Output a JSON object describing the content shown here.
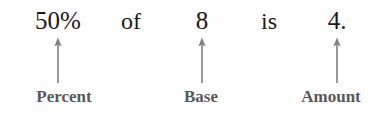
{
  "diagram": {
    "background_color": "#fefefe",
    "equation": {
      "percent": "50%",
      "of": "of",
      "base": "8",
      "is": "is",
      "amount": "4.",
      "text_color": "#1a1a1a"
    },
    "labels": {
      "percent": "Percent",
      "base": "Base",
      "amount": "Amount",
      "text_color": "#595959"
    },
    "arrows": {
      "color": "#808080",
      "direction": "up",
      "count": 3
    }
  }
}
